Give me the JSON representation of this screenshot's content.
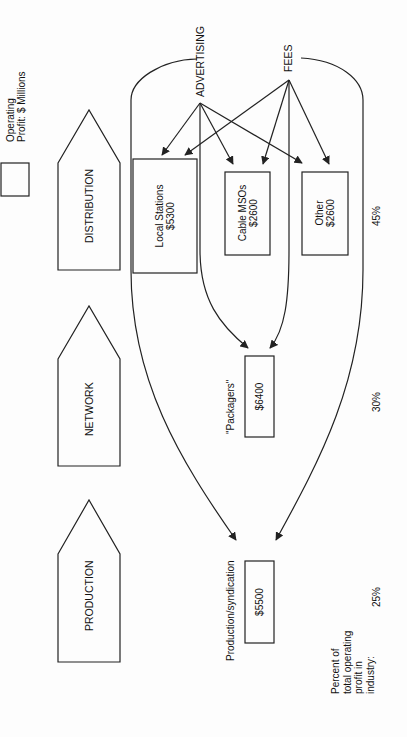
{
  "legend": {
    "line1": "Operating",
    "line2": "Profit: $ Millions"
  },
  "stages": [
    {
      "label": "DISTRIBUTION"
    },
    {
      "label": "NETWORK"
    },
    {
      "label": "PRODUCTION"
    }
  ],
  "revenue_sources": {
    "advertising": "ADVERTISING",
    "fees": "FEES"
  },
  "boxes": {
    "local_stations": {
      "name": "Local Stations",
      "value": "$5300"
    },
    "cable_msos": {
      "name": "Cable MSOs",
      "value": "$2600"
    },
    "other": {
      "name": "Other",
      "value": "$2600"
    },
    "packagers": {
      "label": "\"Packagers\"",
      "value": "$6400"
    },
    "production_syndication": {
      "label": "Production/syndication",
      "value": "$5500"
    }
  },
  "percentages": {
    "heading_lines": [
      "Percent of",
      "total operating",
      "profit in",
      "industry:"
    ],
    "distribution": "45%",
    "network": "30%",
    "production": "25%"
  },
  "colors": {
    "line": "#222222",
    "background": "#fdfdfd"
  }
}
